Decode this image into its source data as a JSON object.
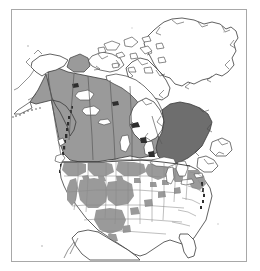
{
  "figure": {
    "kind": "distribution-range-map",
    "frame_border_color": "#a8a8a8",
    "background_color": "#ffffff",
    "has_title": false,
    "has_legend": false,
    "has_axis_labels": false,
    "has_scale_bar": false,
    "has_caption": false,
    "visible_text": ""
  },
  "palette": {
    "water_fill": "#ffffff",
    "land_unshaded_fill": "#ffffff",
    "shading_medium": "#9a9a9a",
    "shading_dark": "#6e6e6e",
    "coastline_stroke": "#3a3a3a",
    "internal_border_stroke": "#5a5a5a",
    "state_border_stroke": "#8a8a8a"
  },
  "shading_classes": [
    {
      "id": "medium",
      "color": "#9a9a9a",
      "label": ""
    },
    {
      "id": "dark",
      "color": "#6e6e6e",
      "label": ""
    },
    {
      "id": "none",
      "color": "#ffffff",
      "label": ""
    }
  ],
  "regions": [
    {
      "name": "greenland",
      "shading": "none"
    },
    {
      "name": "arctic-archipelago",
      "shading": "none"
    },
    {
      "name": "banks-island",
      "shading": "medium"
    },
    {
      "name": "victoria-island",
      "shading": "none"
    },
    {
      "name": "baffin-island",
      "shading": "none"
    },
    {
      "name": "alaska-interior",
      "shading": "medium"
    },
    {
      "name": "alaska-north-slope",
      "shading": "none"
    },
    {
      "name": "yukon",
      "shading": "medium"
    },
    {
      "name": "northwest-territories",
      "shading": "medium"
    },
    {
      "name": "british-columbia",
      "shading": "medium"
    },
    {
      "name": "alberta",
      "shading": "medium"
    },
    {
      "name": "saskatchewan",
      "shading": "medium"
    },
    {
      "name": "manitoba",
      "shading": "medium"
    },
    {
      "name": "ontario",
      "shading": "medium"
    },
    {
      "name": "quebec-labrador",
      "shading": "dark"
    },
    {
      "name": "nunavut-mainland",
      "shading": "none"
    },
    {
      "name": "hudson-bay",
      "shading": "none"
    },
    {
      "name": "newfoundland",
      "shading": "none"
    },
    {
      "name": "maritimes",
      "shading": "none"
    },
    {
      "name": "us-pacific-northwest",
      "shading": "medium"
    },
    {
      "name": "us-northern-rockies",
      "shading": "medium"
    },
    {
      "name": "us-great-basin",
      "shading": "medium"
    },
    {
      "name": "us-southwest",
      "shading": "medium"
    },
    {
      "name": "us-northern-plains",
      "shading": "medium"
    },
    {
      "name": "us-great-lakes-states",
      "shading": "medium"
    },
    {
      "name": "us-northeast",
      "shading": "medium"
    },
    {
      "name": "us-southeast",
      "shading": "none"
    },
    {
      "name": "us-gulf-coast",
      "shading": "none"
    },
    {
      "name": "florida",
      "shading": "none"
    },
    {
      "name": "northern-mexico",
      "shading": "none"
    }
  ],
  "lakes": [
    {
      "name": "lake-superior"
    },
    {
      "name": "lake-michigan"
    },
    {
      "name": "lake-huron"
    },
    {
      "name": "lake-erie"
    },
    {
      "name": "lake-ontario"
    },
    {
      "name": "great-bear-lake"
    },
    {
      "name": "great-slave-lake"
    },
    {
      "name": "lake-winnipeg"
    },
    {
      "name": "lake-athabasca"
    }
  ]
}
